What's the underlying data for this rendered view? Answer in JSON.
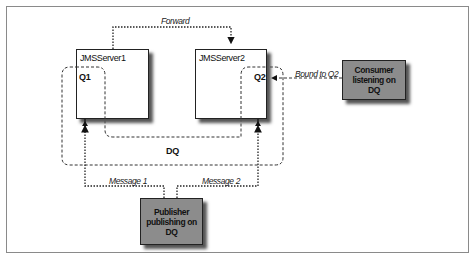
{
  "diagram": {
    "servers": [
      {
        "id": "server1",
        "title": "JMSServer1",
        "queue": "Q1"
      },
      {
        "id": "server2",
        "title": "JMSServer2",
        "queue": "Q2"
      }
    ],
    "distributed_queue": {
      "label": "DQ"
    },
    "consumer": {
      "label": "Consumer\nlistening on\nDQ"
    },
    "publisher": {
      "label": "Publisher\npublishing on\nDQ"
    },
    "edges": {
      "forward": "Forward",
      "bound": "Bound to Q2",
      "message1": "Message 1",
      "message2": "Message 2"
    },
    "colors": {
      "actor_fill": "#8c8c8c",
      "border": "#222222",
      "background": "#ffffff"
    }
  }
}
